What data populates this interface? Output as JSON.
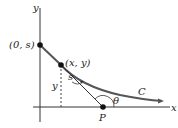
{
  "diagram": {
    "axes": {
      "x_label": "x",
      "y_label": "y"
    },
    "points": {
      "intercept": {
        "label": "(0, s)"
      },
      "curve_point": {
        "label": "(x, y)"
      },
      "P": {
        "label": "P"
      }
    },
    "labels": {
      "height": "y",
      "arc_length": "s",
      "angle": "θ",
      "curve": "C"
    },
    "colors": {
      "curve": "#555555",
      "axes": "#333333",
      "points": "#111111"
    }
  }
}
